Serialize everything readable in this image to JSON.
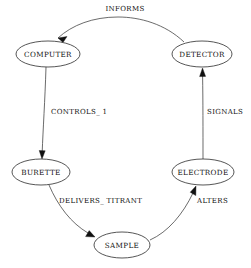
{
  "diagram": {
    "type": "directed-graph",
    "background_color": "#ffffff",
    "node_fill_color": "#ffffff",
    "node_stroke_color": "#2b2b2b",
    "edge_color": "#3a3a3a",
    "text_color": "#111111",
    "nodes": [
      {
        "id": "computer",
        "label": "COMPUTER",
        "cx": 48,
        "cy": 54,
        "rx": 32,
        "ry": 13
      },
      {
        "id": "detector",
        "label": "DETECTOR",
        "cx": 202,
        "cy": 54,
        "rx": 30,
        "ry": 13
      },
      {
        "id": "burette",
        "label": "BURETTE",
        "cx": 41,
        "cy": 172,
        "rx": 29,
        "ry": 13
      },
      {
        "id": "electrode",
        "label": "ELECTRODE",
        "cx": 203,
        "cy": 172,
        "rx": 31,
        "ry": 13
      },
      {
        "id": "sample",
        "label": "SAMPLE",
        "cx": 122,
        "cy": 245,
        "rx": 28,
        "ry": 13
      }
    ],
    "edges": [
      {
        "id": "informs",
        "label": "INFORMS",
        "from": "detector",
        "to": "computer",
        "label_x": 125,
        "label_y": 11,
        "label_anchor": "middle"
      },
      {
        "id": "controls-1",
        "label": "CONTROLS_ 1",
        "from": "computer",
        "to": "burette",
        "label_x": 51,
        "label_y": 114,
        "label_anchor": "start"
      },
      {
        "id": "delivers-titrant",
        "label": "DELIVERS_ TITRANT",
        "from": "burette",
        "to": "sample",
        "label_x": 59,
        "label_y": 203,
        "label_anchor": "start"
      },
      {
        "id": "alters",
        "label": "ALTERS",
        "from": "sample",
        "to": "electrode",
        "label_x": 197,
        "label_y": 203,
        "label_anchor": "start"
      },
      {
        "id": "signals",
        "label": "SIGNALS",
        "from": "electrode",
        "to": "detector",
        "label_x": 207,
        "label_y": 114,
        "label_anchor": "start"
      }
    ]
  }
}
